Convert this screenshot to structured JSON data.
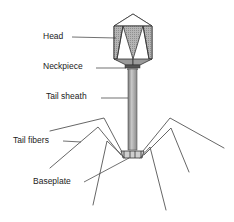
{
  "diagram": {
    "labels": {
      "head": "Head",
      "neckpiece": "Neckpiece",
      "tail_sheath": "Tail sheath",
      "tail_fibers": "Tail fibers",
      "baseplate": "Baseplate"
    }
  }
}
